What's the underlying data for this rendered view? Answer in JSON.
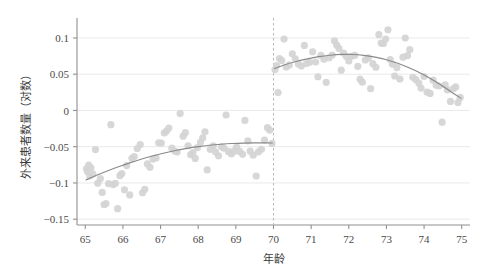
{
  "chart_data": {
    "type": "scatter",
    "title": "",
    "xlabel": "年龄",
    "ylabel": "外来患者数量（对数）",
    "xlim": [
      64.78,
      75.22
    ],
    "ylim": [
      -0.158,
      0.122
    ],
    "xticks": [
      "65",
      "66",
      "67",
      "68",
      "69",
      "70",
      "71",
      "72",
      "73",
      "74",
      "75"
    ],
    "xtick_values": [
      65,
      66,
      67,
      68,
      69,
      70,
      71,
      72,
      73,
      74,
      75
    ],
    "yticks": [
      "0.1",
      "0.05",
      "0",
      "-0.05",
      "-0.1",
      "-0.15"
    ],
    "ytick_values": [
      0.1,
      0.05,
      0,
      -0.05,
      -0.1,
      -0.15
    ],
    "grid": "horizontal",
    "legend": "none",
    "cutoff": {
      "value": 70,
      "style": "dashed",
      "color": "#b9b9b9",
      "label": ""
    },
    "point_color": "#d4d4d4",
    "line_color": "#8a8a8a",
    "grid_color": "#e9e9e9",
    "axis_color": "#909090",
    "series": [
      {
        "name": "left-bin-means",
        "side": "left",
        "points": [
          [
            65.03,
            -0.0805
          ],
          [
            65.06,
            -0.0845
          ],
          [
            65.09,
            -0.0755
          ],
          [
            65.12,
            -0.0905
          ],
          [
            65.15,
            -0.0792
          ],
          [
            65.2,
            -0.0873
          ],
          [
            65.27,
            -0.054
          ],
          [
            65.33,
            -0.1005
          ],
          [
            65.4,
            -0.094
          ],
          [
            65.45,
            -0.113
          ],
          [
            65.5,
            -0.13
          ],
          [
            65.55,
            -0.1285
          ],
          [
            65.62,
            -0.101
          ],
          [
            65.68,
            -0.0196
          ],
          [
            65.74,
            -0.1022
          ],
          [
            65.8,
            -0.1005
          ],
          [
            65.86,
            -0.1355
          ],
          [
            65.92,
            -0.09
          ],
          [
            65.97,
            -0.087
          ],
          [
            66.04,
            -0.1095
          ],
          [
            66.1,
            -0.076
          ],
          [
            66.18,
            -0.1165
          ],
          [
            66.24,
            -0.066
          ],
          [
            66.3,
            -0.0638
          ],
          [
            66.38,
            -0.0525
          ],
          [
            66.46,
            -0.047
          ],
          [
            66.52,
            -0.1135
          ],
          [
            66.58,
            -0.109
          ],
          [
            66.65,
            -0.0737
          ],
          [
            66.72,
            -0.0785
          ],
          [
            66.8,
            -0.067
          ],
          [
            66.88,
            -0.0655
          ],
          [
            66.95,
            -0.0447
          ],
          [
            67.02,
            -0.045
          ],
          [
            67.1,
            -0.031
          ],
          [
            67.16,
            -0.0285
          ],
          [
            67.22,
            -0.0243
          ],
          [
            67.3,
            -0.052
          ],
          [
            67.38,
            -0.0563
          ],
          [
            67.44,
            -0.0574
          ],
          [
            67.52,
            -0.0043
          ],
          [
            67.6,
            -0.0355
          ],
          [
            67.66,
            -0.0305
          ],
          [
            67.73,
            -0.0487
          ],
          [
            67.8,
            -0.061
          ],
          [
            67.86,
            -0.0583
          ],
          [
            67.92,
            -0.0662
          ],
          [
            67.98,
            -0.0512
          ],
          [
            68.06,
            -0.044
          ],
          [
            68.12,
            -0.0377
          ],
          [
            68.18,
            -0.0295
          ],
          [
            68.24,
            -0.082
          ],
          [
            68.32,
            -0.0537
          ],
          [
            68.4,
            -0.0487
          ],
          [
            68.46,
            -0.057
          ],
          [
            68.54,
            -0.0625
          ],
          [
            68.62,
            -0.05
          ],
          [
            68.68,
            -0.052
          ],
          [
            68.74,
            -0.0063
          ],
          [
            68.8,
            -0.0565
          ],
          [
            68.88,
            -0.06
          ],
          [
            68.95,
            -0.0562
          ],
          [
            69.02,
            -0.0507
          ],
          [
            69.1,
            -0.0565
          ],
          [
            69.18,
            -0.0605
          ],
          [
            69.24,
            -0.0137
          ],
          [
            69.32,
            -0.042
          ],
          [
            69.38,
            -0.056
          ],
          [
            69.46,
            -0.0617
          ],
          [
            69.54,
            -0.0905
          ],
          [
            69.6,
            -0.057
          ],
          [
            69.68,
            -0.0535
          ],
          [
            69.76,
            -0.041
          ],
          [
            69.84,
            -0.0238
          ],
          [
            69.9,
            -0.027
          ],
          [
            69.96,
            -0.0455
          ]
        ]
      },
      {
        "name": "right-bin-means",
        "side": "right",
        "points": [
          [
            70.04,
            0.0565
          ],
          [
            70.08,
            0.062
          ],
          [
            70.12,
            0.0247
          ],
          [
            70.16,
            0.0715
          ],
          [
            70.22,
            0.0688
          ],
          [
            70.28,
            0.0985
          ],
          [
            70.34,
            0.0598
          ],
          [
            70.42,
            0.0628
          ],
          [
            70.5,
            0.0782
          ],
          [
            70.58,
            0.0712
          ],
          [
            70.66,
            0.064
          ],
          [
            70.74,
            0.0613
          ],
          [
            70.82,
            0.0897
          ],
          [
            70.88,
            0.0647
          ],
          [
            70.96,
            0.0665
          ],
          [
            71.04,
            0.081
          ],
          [
            71.12,
            0.0668
          ],
          [
            71.18,
            0.0465
          ],
          [
            71.26,
            0.076
          ],
          [
            71.34,
            0.0705
          ],
          [
            71.4,
            0.0388
          ],
          [
            71.48,
            0.0727
          ],
          [
            71.56,
            0.0765
          ],
          [
            71.62,
            0.096
          ],
          [
            71.68,
            0.09
          ],
          [
            71.74,
            0.0855
          ],
          [
            71.8,
            0.0555
          ],
          [
            71.86,
            0.079
          ],
          [
            71.94,
            0.0745
          ],
          [
            72.0,
            0.0682
          ],
          [
            72.08,
            0.075
          ],
          [
            72.16,
            0.076
          ],
          [
            72.24,
            0.0608
          ],
          [
            72.3,
            0.0432
          ],
          [
            72.36,
            0.039
          ],
          [
            72.44,
            0.0697
          ],
          [
            72.52,
            0.0726
          ],
          [
            72.58,
            0.03
          ],
          [
            72.64,
            0.0645
          ],
          [
            72.72,
            0.0596
          ],
          [
            72.8,
            0.1045
          ],
          [
            72.86,
            0.093
          ],
          [
            72.92,
            0.0925
          ],
          [
            72.98,
            0.0985
          ],
          [
            73.04,
            0.1113
          ],
          [
            73.1,
            0.0702
          ],
          [
            73.16,
            0.0637
          ],
          [
            73.22,
            0.0475
          ],
          [
            73.28,
            0.0592
          ],
          [
            73.36,
            0.0433
          ],
          [
            73.44,
            0.0735
          ],
          [
            73.5,
            0.0998
          ],
          [
            73.56,
            0.0757
          ],
          [
            73.62,
            0.084
          ],
          [
            73.7,
            0.0458
          ],
          [
            73.78,
            0.0427
          ],
          [
            73.86,
            0.0377
          ],
          [
            73.92,
            0.0308
          ],
          [
            74.0,
            0.0468
          ],
          [
            74.08,
            0.0252
          ],
          [
            74.16,
            0.0235
          ],
          [
            74.24,
            0.0418
          ],
          [
            74.32,
            0.0348
          ],
          [
            74.4,
            0.0337
          ],
          [
            74.48,
            -0.0162
          ],
          [
            74.56,
            0.0352
          ],
          [
            74.62,
            0.0283
          ],
          [
            74.7,
            0.0125
          ],
          [
            74.78,
            0.0303
          ],
          [
            74.84,
            0.0325
          ],
          [
            74.9,
            0.0108
          ],
          [
            74.96,
            0.018
          ]
        ]
      }
    ],
    "fits": [
      {
        "name": "left-quadratic-fit",
        "side": "left",
        "domain": [
          65.02,
          69.97
        ],
        "coeffs_note": "concave increasing",
        "path_points": [
          [
            65.02,
            -0.0958
          ],
          [
            65.3,
            -0.0895
          ],
          [
            65.6,
            -0.0832
          ],
          [
            65.9,
            -0.0774
          ],
          [
            66.2,
            -0.072
          ],
          [
            66.5,
            -0.067
          ],
          [
            66.8,
            -0.0625
          ],
          [
            67.1,
            -0.0586
          ],
          [
            67.4,
            -0.0552
          ],
          [
            67.7,
            -0.0523
          ],
          [
            68.0,
            -0.0499
          ],
          [
            68.3,
            -0.048
          ],
          [
            68.6,
            -0.0466
          ],
          [
            68.9,
            -0.0456
          ],
          [
            69.2,
            -0.045
          ],
          [
            69.5,
            -0.0448
          ],
          [
            69.75,
            -0.0448
          ],
          [
            69.97,
            -0.0449
          ]
        ]
      },
      {
        "name": "right-quadratic-fit",
        "side": "right",
        "domain": [
          70.03,
          74.98
        ],
        "coeffs_note": "inverted U, peak near 71.9",
        "path_points": [
          [
            70.03,
            0.058
          ],
          [
            70.3,
            0.063
          ],
          [
            70.6,
            0.0675
          ],
          [
            70.9,
            0.0712
          ],
          [
            71.2,
            0.0742
          ],
          [
            71.5,
            0.0762
          ],
          [
            71.8,
            0.0773
          ],
          [
            72.1,
            0.0772
          ],
          [
            72.4,
            0.076
          ],
          [
            72.7,
            0.0735
          ],
          [
            73.0,
            0.07
          ],
          [
            73.3,
            0.0652
          ],
          [
            73.6,
            0.059
          ],
          [
            73.9,
            0.0518
          ],
          [
            74.2,
            0.0432
          ],
          [
            74.5,
            0.0335
          ],
          [
            74.75,
            0.0245
          ],
          [
            74.98,
            0.017
          ]
        ]
      }
    ]
  }
}
